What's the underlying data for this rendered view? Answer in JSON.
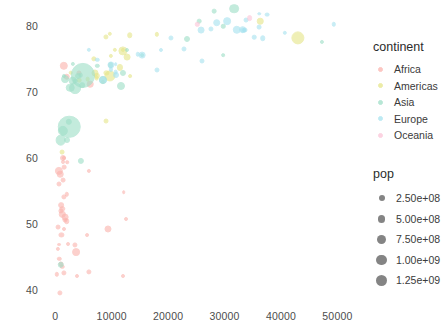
{
  "chart_data": {
    "type": "scatter",
    "title": "",
    "xlabel": "",
    "ylabel": "",
    "xlim": [
      -2000,
      54000
    ],
    "ylim": [
      38.5,
      83
    ],
    "grid": false,
    "xticks": [
      "0",
      "10000",
      "20000",
      "30000",
      "40000",
      "50000"
    ],
    "xtick_values": [
      0,
      10000,
      20000,
      30000,
      40000,
      50000
    ],
    "yticks": [
      "40",
      "50",
      "60",
      "70",
      "80"
    ],
    "ytick_values": [
      40,
      50,
      60,
      70,
      80
    ],
    "size_variable": "pop",
    "color_variable": "continent",
    "series": [
      {
        "name": "Africa",
        "color": "#fbb4ae",
        "points": [
          {
            "x": 2014,
            "y": 72.3,
            "pop": 33333216
          },
          {
            "x": 5937,
            "y": 42.7,
            "pop": 12420476
          },
          {
            "x": 1441,
            "y": 56.7,
            "pop": 8078314
          },
          {
            "x": 12570,
            "y": 50.7,
            "pop": 1639131
          },
          {
            "x": 1217,
            "y": 52.3,
            "pop": 14326203
          },
          {
            "x": 430,
            "y": 49.6,
            "pop": 8390505
          },
          {
            "x": 2042,
            "y": 50.4,
            "pop": 17696293
          },
          {
            "x": 706,
            "y": 44.7,
            "pop": 4369038
          },
          {
            "x": 1704,
            "y": 50.6,
            "pop": 10238807
          },
          {
            "x": 986,
            "y": 44.0,
            "pop": 9875024
          },
          {
            "x": 277,
            "y": 42.4,
            "pop": 4133884
          },
          {
            "x": 3632,
            "y": 45.7,
            "pop": 64606759
          },
          {
            "x": 1544,
            "y": 73.9,
            "pop": 80264543
          },
          {
            "x": 2082,
            "y": 59.4,
            "pop": 496374
          },
          {
            "x": 5581,
            "y": 48.3,
            "pop": 1454867
          },
          {
            "x": 12154,
            "y": 54.8,
            "pop": 551201
          },
          {
            "x": 641,
            "y": 58.0,
            "pop": 76511887
          },
          {
            "x": 690,
            "y": 46.9,
            "pop": 1688359
          },
          {
            "x": 1327,
            "y": 59.4,
            "pop": 1454867
          },
          {
            "x": 1441,
            "y": 60.0,
            "pop": 22873338
          },
          {
            "x": 619,
            "y": 56.0,
            "pop": 9947814
          },
          {
            "x": 2280,
            "y": 47.0,
            "pop": 1688359
          },
          {
            "x": 1463,
            "y": 54.1,
            "pop": 12031795
          },
          {
            "x": 1569,
            "y": 42.6,
            "pop": 12311143
          },
          {
            "x": 414,
            "y": 46.2,
            "pop": 3193942
          },
          {
            "x": 12057,
            "y": 42.1,
            "pop": 2055080
          },
          {
            "x": 1044,
            "y": 52.9,
            "pop": 19167654
          },
          {
            "x": 759,
            "y": 39.6,
            "pop": 12194966
          },
          {
            "x": 3820,
            "y": 42.1,
            "pop": 2012649
          },
          {
            "x": 1271,
            "y": 43.5,
            "pop": 4906585
          },
          {
            "x": 1075,
            "y": 48.3,
            "pop": 11746035
          },
          {
            "x": 1217,
            "y": 51.5,
            "pop": 31889923
          },
          {
            "x": 2082,
            "y": 54.5,
            "pop": 4553009
          },
          {
            "x": 823,
            "y": 57.5,
            "pop": 34593779
          },
          {
            "x": 1598,
            "y": 58.6,
            "pop": 6980412
          },
          {
            "x": 1713,
            "y": 51.0,
            "pop": 38139640
          },
          {
            "x": 4184,
            "y": 72.8,
            "pop": 10276158
          },
          {
            "x": 5937,
            "y": 58.0,
            "pop": 3101278
          },
          {
            "x": 3533,
            "y": 46.9,
            "pop": 11416987
          },
          {
            "x": 926,
            "y": 52.0,
            "pop": 12311143
          },
          {
            "x": 1569,
            "y": 49.3,
            "pop": 2012649
          },
          {
            "x": 6223,
            "y": 71.2,
            "pop": 33757175
          },
          {
            "x": 9270,
            "y": 49.3,
            "pop": 43997828
          },
          {
            "x": 1598,
            "y": 60.0,
            "pop": 2874027
          }
        ]
      },
      {
        "name": "Americas",
        "color": "#e6e68a",
        "points": [
          {
            "x": 12779,
            "y": 75.3,
            "pop": 40301927
          },
          {
            "x": 9066,
            "y": 65.6,
            "pop": 9119152
          },
          {
            "x": 9645,
            "y": 72.4,
            "pop": 190010647
          },
          {
            "x": 36319,
            "y": 80.7,
            "pop": 33390141
          },
          {
            "x": 13171,
            "y": 78.6,
            "pop": 16284741
          },
          {
            "x": 7007,
            "y": 72.9,
            "pop": 44227550
          },
          {
            "x": 9645,
            "y": 78.8,
            "pop": 4133884
          },
          {
            "x": 8948,
            "y": 78.3,
            "pop": 11416987
          },
          {
            "x": 6873,
            "y": 75.0,
            "pop": 13755680
          },
          {
            "x": 5728,
            "y": 71.9,
            "pop": 6939688
          },
          {
            "x": 9065,
            "y": 72.9,
            "pop": 12572928
          },
          {
            "x": 1201,
            "y": 60.9,
            "pop": 8502814
          },
          {
            "x": 7320,
            "y": 72.1,
            "pop": 7483763
          },
          {
            "x": 11977,
            "y": 76.4,
            "pop": 2780132
          },
          {
            "x": 11978,
            "y": 76.2,
            "pop": 108700891
          },
          {
            "x": 2749,
            "y": 72.9,
            "pop": 5675356
          },
          {
            "x": 9809,
            "y": 75.5,
            "pop": 3242173
          },
          {
            "x": 4172,
            "y": 71.8,
            "pop": 6667147
          },
          {
            "x": 7408,
            "y": 72.4,
            "pop": 28674757
          },
          {
            "x": 18009,
            "y": 78.7,
            "pop": 3600523
          },
          {
            "x": 42952,
            "y": 78.2,
            "pop": 301139947
          },
          {
            "x": 10611,
            "y": 76.4,
            "pop": 3447496
          },
          {
            "x": 11416,
            "y": 73.7,
            "pop": 26084662
          },
          {
            "x": 13206,
            "y": 72.4,
            "pop": 1056608
          },
          {
            "x": 8458,
            "y": 71.5,
            "pop": 3242173
          }
        ]
      },
      {
        "name": "Asia",
        "color": "#9fdfc8",
        "points": [
          {
            "x": 974,
            "y": 43.8,
            "pop": 31889923
          },
          {
            "x": 1391,
            "y": 64.1,
            "pop": 150448339
          },
          {
            "x": 29796,
            "y": 75.6,
            "pop": 708573
          },
          {
            "x": 4959,
            "y": 72.5,
            "pop": 1318683096
          },
          {
            "x": 28118,
            "y": 82.2,
            "pop": 6980412
          },
          {
            "x": 2452,
            "y": 64.7,
            "pop": 1110396331
          },
          {
            "x": 3541,
            "y": 70.6,
            "pop": 223547000
          },
          {
            "x": 11605,
            "y": 70.9,
            "pop": 69453570
          },
          {
            "x": 4471,
            "y": 59.5,
            "pop": 27499638
          },
          {
            "x": 25523,
            "y": 80.7,
            "pop": 6426679
          },
          {
            "x": 31656,
            "y": 82.6,
            "pop": 127467972
          },
          {
            "x": 4519,
            "y": 72.5,
            "pop": 6053193
          },
          {
            "x": 47306,
            "y": 77.6,
            "pop": 2505559
          },
          {
            "x": 3540,
            "y": 71.7,
            "pop": 4292095
          },
          {
            "x": 12057,
            "y": 72.8,
            "pop": 24821286
          },
          {
            "x": 1593,
            "y": 72.4,
            "pop": 2874027
          },
          {
            "x": 2452,
            "y": 65.5,
            "pop": 28901790
          },
          {
            "x": 3095,
            "y": 74.2,
            "pop": 3204897
          },
          {
            "x": 944,
            "y": 62.7,
            "pop": 165285592
          },
          {
            "x": 3095,
            "y": 71.7,
            "pop": 91077287
          },
          {
            "x": 15389,
            "y": 75.6,
            "pop": 841934
          },
          {
            "x": 29796,
            "y": 79.9,
            "pop": 4553009
          },
          {
            "x": 3970,
            "y": 72.4,
            "pop": 22739000
          },
          {
            "x": 9786,
            "y": 74.1,
            "pop": 20378239
          },
          {
            "x": 1803,
            "y": 72.0,
            "pop": 65068149
          },
          {
            "x": 8458,
            "y": 71.8,
            "pop": 71158647
          },
          {
            "x": 2606,
            "y": 70.6,
            "pop": 85262356
          },
          {
            "x": 2013,
            "y": 62.7,
            "pop": 22211743
          },
          {
            "x": 23348,
            "y": 78.0,
            "pop": 23301725
          },
          {
            "x": 12779,
            "y": 76.4,
            "pop": 2009245
          },
          {
            "x": 7458,
            "y": 73.9,
            "pop": 4115000
          },
          {
            "x": 4811,
            "y": 71.0,
            "pop": 19314747
          }
        ]
      },
      {
        "name": "Europe",
        "color": "#a8e3f0",
        "points": [
          {
            "x": 5937,
            "y": 76.4,
            "pop": 3600523
          },
          {
            "x": 36126,
            "y": 79.8,
            "pop": 8199783
          },
          {
            "x": 33693,
            "y": 79.4,
            "pop": 10392226
          },
          {
            "x": 7446,
            "y": 74.9,
            "pop": 4552198
          },
          {
            "x": 10681,
            "y": 73.0,
            "pop": 7322858
          },
          {
            "x": 14619,
            "y": 75.7,
            "pop": 4493312
          },
          {
            "x": 22833,
            "y": 76.5,
            "pop": 10228744
          },
          {
            "x": 35278,
            "y": 78.3,
            "pop": 5468120
          },
          {
            "x": 33207,
            "y": 79.3,
            "pop": 5238460
          },
          {
            "x": 30470,
            "y": 80.7,
            "pop": 61083916
          },
          {
            "x": 32170,
            "y": 79.4,
            "pop": 82400996
          },
          {
            "x": 27538,
            "y": 79.5,
            "pop": 10706290
          },
          {
            "x": 18009,
            "y": 73.3,
            "pop": 9956108
          },
          {
            "x": 36180,
            "y": 81.8,
            "pop": 301931
          },
          {
            "x": 40676,
            "y": 78.9,
            "pop": 4109086
          },
          {
            "x": 28570,
            "y": 80.5,
            "pop": 58147733
          },
          {
            "x": 10680,
            "y": 74.2,
            "pop": 684736
          },
          {
            "x": 9795,
            "y": 73.4,
            "pop": 2780132
          },
          {
            "x": 33519,
            "y": 79.3,
            "pop": 35610
          },
          {
            "x": 36798,
            "y": 78.1,
            "pop": 16570613
          },
          {
            "x": 49357,
            "y": 80.2,
            "pop": 4627926
          },
          {
            "x": 15389,
            "y": 75.6,
            "pop": 38518241
          },
          {
            "x": 20510,
            "y": 78.1,
            "pop": 10642836
          },
          {
            "x": 10808,
            "y": 72.5,
            "pop": 22276056
          },
          {
            "x": 26074,
            "y": 74.7,
            "pop": 10150265
          },
          {
            "x": 18678,
            "y": 76.4,
            "pop": 2009245
          },
          {
            "x": 25768,
            "y": 79.4,
            "pop": 40448191
          },
          {
            "x": 33860,
            "y": 80.9,
            "pop": 9031088
          },
          {
            "x": 37506,
            "y": 81.7,
            "pop": 7554661
          },
          {
            "x": 8458,
            "y": 71.8,
            "pop": 71158647
          },
          {
            "x": 33203,
            "y": 79.4,
            "pop": 60776238
          },
          {
            "x": 9786,
            "y": 74.1,
            "pop": 46053000
          }
        ]
      },
      {
        "name": "Oceania",
        "color": "#fcc5d8",
        "points": [
          {
            "x": 34435,
            "y": 81.2,
            "pop": 20434176
          },
          {
            "x": 25185,
            "y": 80.2,
            "pop": 4115771
          }
        ]
      }
    ]
  },
  "legends": {
    "continent": {
      "title": "continent",
      "items": [
        {
          "label": "Africa",
          "color": "#fbb4ae"
        },
        {
          "label": "Americas",
          "color": "#e6e68a"
        },
        {
          "label": "Asia",
          "color": "#9fdfc8"
        },
        {
          "label": "Europe",
          "color": "#a8e3f0"
        },
        {
          "label": "Oceania",
          "color": "#fcc5d8"
        }
      ]
    },
    "pop": {
      "title": "pop",
      "color": "#6f6f6f",
      "items": [
        {
          "label": "2.50e+08",
          "value": 250000000,
          "dot": 6
        },
        {
          "label": "5.00e+08",
          "value": 500000000,
          "dot": 7.6
        },
        {
          "label": "7.50e+08",
          "value": 750000000,
          "dot": 9
        },
        {
          "label": "1.00e+09",
          "value": 1000000000,
          "dot": 10.2
        },
        {
          "label": "1.25e+09",
          "value": 1250000000,
          "dot": 11.4
        }
      ]
    }
  }
}
